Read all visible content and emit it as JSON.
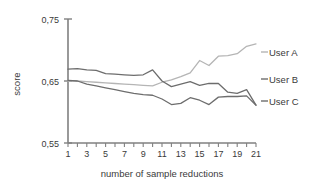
{
  "chart_data": {
    "type": "line",
    "title": "",
    "xlabel": "number of sample reductions",
    "ylabel": "score",
    "xlim": [
      1,
      21
    ],
    "ylim": [
      0.55,
      0.75
    ],
    "grid": false,
    "legend_position": "right",
    "y_tick_labels": [
      "0,75",
      "0,65",
      "0,55"
    ],
    "y_tick_values": [
      0.75,
      0.65,
      0.55
    ],
    "x_tick_values": [
      1,
      2,
      3,
      4,
      5,
      6,
      7,
      8,
      9,
      10,
      11,
      12,
      13,
      14,
      15,
      16,
      17,
      18,
      19,
      20,
      21
    ],
    "x_tick_labels": [
      "1",
      "",
      "3",
      "",
      "5",
      "",
      "7",
      "",
      "9",
      "",
      "11",
      "",
      "13",
      "",
      "15",
      "",
      "17",
      "",
      "19",
      "",
      "21"
    ],
    "x": [
      1,
      2,
      3,
      4,
      5,
      6,
      7,
      8,
      9,
      10,
      11,
      12,
      13,
      14,
      15,
      16,
      17,
      18,
      19,
      20,
      21
    ],
    "series": [
      {
        "name": "User A",
        "color": "#b5b5b5",
        "values": [
          0.65,
          0.65,
          0.649,
          0.648,
          0.647,
          0.646,
          0.645,
          0.644,
          0.643,
          0.642,
          0.648,
          0.652,
          0.657,
          0.663,
          0.683,
          0.675,
          0.69,
          0.691,
          0.694,
          0.706,
          0.71
        ]
      },
      {
        "name": "User B",
        "color": "#6d6d6d",
        "values": [
          0.669,
          0.67,
          0.668,
          0.667,
          0.662,
          0.661,
          0.66,
          0.659,
          0.66,
          0.668,
          0.65,
          0.641,
          0.645,
          0.649,
          0.643,
          0.646,
          0.646,
          0.632,
          0.63,
          0.636,
          0.611
        ]
      },
      {
        "name": "User C",
        "color": "#6d6d6d",
        "values": [
          0.651,
          0.65,
          0.645,
          0.642,
          0.639,
          0.636,
          0.633,
          0.63,
          0.628,
          0.627,
          0.621,
          0.612,
          0.614,
          0.623,
          0.619,
          0.612,
          0.624,
          0.625,
          0.625,
          0.626,
          0.611
        ]
      }
    ]
  },
  "legend": {
    "items": [
      {
        "label": "User A"
      },
      {
        "label": "User B"
      },
      {
        "label": "User C"
      }
    ]
  },
  "axes": {
    "x_title": "number of sample reductions",
    "y_title": "score"
  }
}
